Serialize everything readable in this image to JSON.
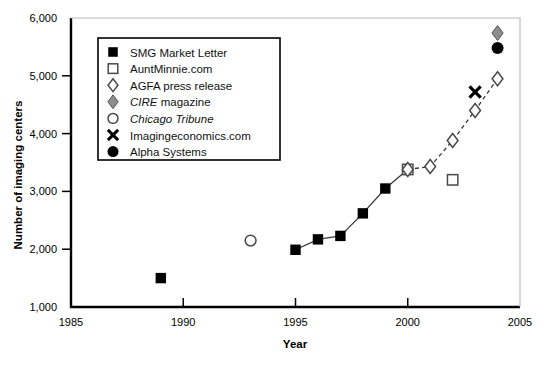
{
  "chart_data": {
    "type": "scatter",
    "title": "",
    "xlabel": "Year",
    "ylabel": "Number of imaging centers",
    "xlim": [
      1985,
      2005
    ],
    "ylim": [
      1000,
      6000
    ],
    "xticks": [
      "1985",
      "1990",
      "1995",
      "2000",
      "2005"
    ],
    "xtick_values": [
      1985,
      1990,
      1995,
      2000,
      2005
    ],
    "yticks": [
      "1,000",
      "2,000",
      "3,000",
      "4,000",
      "5,000",
      "6,000"
    ],
    "ytick_values": [
      1000,
      2000,
      3000,
      4000,
      5000,
      6000
    ],
    "grid": false,
    "legend_position": "upper-left",
    "series": [
      {
        "name": "SMG Market Letter",
        "marker": "filled-square",
        "line": "solid",
        "points": [
          {
            "x": 1989,
            "y": 1500
          },
          {
            "x": 1995,
            "y": 1990
          },
          {
            "x": 1996,
            "y": 2170
          },
          {
            "x": 1997,
            "y": 2230
          },
          {
            "x": 1998,
            "y": 2620
          },
          {
            "x": 1999,
            "y": 3050
          },
          {
            "x": 2000,
            "y": 3380
          }
        ],
        "line_from_index": 1
      },
      {
        "name": "AuntMinnie.com",
        "marker": "open-square",
        "line": "none",
        "points": [
          {
            "x": 2000,
            "y": 3380
          },
          {
            "x": 2002,
            "y": 3200
          }
        ]
      },
      {
        "name": "AGFA press release",
        "marker": "open-diamond",
        "line": "dashed",
        "points": [
          {
            "x": 2000,
            "y": 3380
          },
          {
            "x": 2001,
            "y": 3430
          },
          {
            "x": 2002,
            "y": 3880
          },
          {
            "x": 2003,
            "y": 4400
          },
          {
            "x": 2004,
            "y": 4950
          }
        ]
      },
      {
        "name": "CIRE magazine",
        "marker": "gray-diamond",
        "line": "none",
        "points": [
          {
            "x": 2004,
            "y": 5740
          }
        ]
      },
      {
        "name": "Chicago Tribune",
        "marker": "open-circle",
        "line": "none",
        "points": [
          {
            "x": 1993,
            "y": 2150
          }
        ]
      },
      {
        "name": "Imagingeconomics.com",
        "marker": "cross-x",
        "line": "none",
        "points": [
          {
            "x": 2003,
            "y": 4720
          }
        ]
      },
      {
        "name": "Alpha Systems",
        "marker": "filled-circle",
        "line": "none",
        "points": [
          {
            "x": 2004,
            "y": 5480
          }
        ]
      }
    ]
  },
  "legend": {
    "items": [
      {
        "label": "SMG Market Letter",
        "marker": "filled-square",
        "italic_part": ""
      },
      {
        "label": "AuntMinnie.com",
        "marker": "open-square",
        "italic_part": ""
      },
      {
        "label": "AGFA press release",
        "marker": "open-diamond",
        "italic_part": ""
      },
      {
        "label": "CIRE magazine",
        "marker": "gray-diamond",
        "italic_part": "CIRE"
      },
      {
        "label": "Chicago Tribune",
        "marker": "open-circle",
        "italic_part": "Chicago Tribune"
      },
      {
        "label": "Imagingeconomics.com",
        "marker": "cross-x",
        "italic_part": ""
      },
      {
        "label": "Alpha Systems",
        "marker": "filled-circle",
        "italic_part": ""
      }
    ]
  },
  "colors": {
    "axis": "#000000",
    "marker_fill": "#000000",
    "marker_open": "#ffffff",
    "gray_marker": "#8d8d8d",
    "line": "#3a3a3a",
    "legend_border": "#000000"
  }
}
